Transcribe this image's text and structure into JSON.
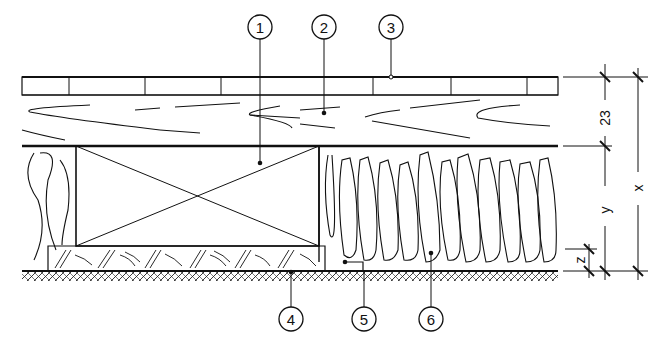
{
  "diagram": {
    "type": "construction-section",
    "callouts": [
      {
        "id": "1",
        "label": "1",
        "x": 260,
        "y": 27,
        "target_x": 260,
        "target_y": 163
      },
      {
        "id": "2",
        "label": "2",
        "x": 324,
        "y": 27,
        "target_x": 324,
        "target_y": 113
      },
      {
        "id": "3",
        "label": "3",
        "x": 391,
        "y": 27,
        "target_x": 391,
        "target_y": 77
      },
      {
        "id": "4",
        "label": "4",
        "x": 291,
        "y": 319,
        "target_x": 291,
        "target_y": 272
      },
      {
        "id": "5",
        "label": "5",
        "x": 364,
        "y": 319,
        "target_x": 364,
        "target_y": 262
      },
      {
        "id": "6",
        "label": "6",
        "x": 431,
        "y": 319,
        "target_x": 431,
        "target_y": 253
      }
    ],
    "dimensions": [
      {
        "id": "dim-23",
        "label": "23",
        "orientation": "vertical",
        "x": 605,
        "y1": 77,
        "y2": 146
      },
      {
        "id": "dim-y",
        "label": "y",
        "orientation": "vertical",
        "x": 605,
        "y1": 146,
        "y2": 271
      },
      {
        "id": "dim-x",
        "label": "x",
        "orientation": "vertical",
        "x": 638,
        "y1": 77,
        "y2": 271
      },
      {
        "id": "dim-z",
        "label": "z",
        "orientation": "vertical",
        "x": 589,
        "y1": 249,
        "y2": 271
      }
    ],
    "layers": [
      {
        "name": "top-board-layer",
        "y_top": 77,
        "y_bottom": 95
      },
      {
        "name": "timber-layer",
        "y_top": 95,
        "y_bottom": 146
      },
      {
        "name": "beam-insulation-layer",
        "y_top": 146,
        "y_bottom": 246
      },
      {
        "name": "screed-layer",
        "y_top": 246,
        "y_bottom": 271
      },
      {
        "name": "base-slab",
        "y_top": 271,
        "y_bottom": 282
      }
    ],
    "colors": {
      "ink": "#111111",
      "background": "#ffffff"
    }
  }
}
